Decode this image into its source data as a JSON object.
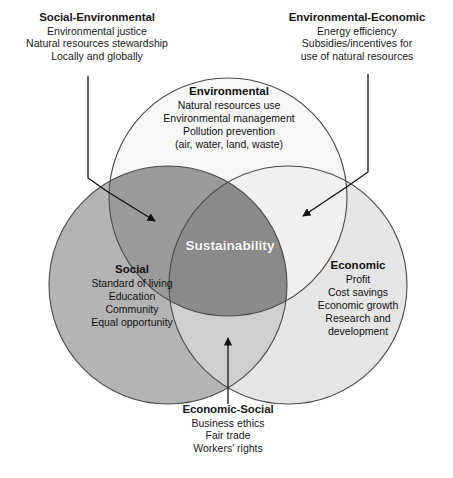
{
  "diagram": {
    "type": "venn-3-circle",
    "center_label": "Sustainability",
    "colors": {
      "social_fill": "#b4b4b4",
      "environmental_fill": "#f7f7f7",
      "economic_fill": "#e6e6e6",
      "social_environmental_fill": "#9a9a9a",
      "environmental_economic_fill": "#f2f2f2",
      "economic_social_fill": "#cfcfcf",
      "center_fill": "#8a8a8a",
      "stroke": "#4a4a4a",
      "center_text": "#ffffff",
      "body_text": "#1a1a1a",
      "background": "#ffffff"
    },
    "circles": [
      {
        "id": "environmental",
        "title": "Environmental",
        "lines": [
          "Natural resources use",
          "Environmental management",
          "Pollution prevention",
          "(air, water, land, waste)"
        ]
      },
      {
        "id": "social",
        "title": "Social",
        "lines": [
          "Standard of living",
          "Education",
          "Community",
          "Equal opportunity"
        ]
      },
      {
        "id": "economic",
        "title": "Economic",
        "lines": [
          "Profit",
          "Cost savings",
          "Economic growth",
          "Research and",
          "development"
        ]
      }
    ],
    "callouts": [
      {
        "id": "social-environmental",
        "title": "Social-Environmental",
        "lines": [
          "Environmental justice",
          "Natural resources stewardship",
          "Locally and globally"
        ]
      },
      {
        "id": "environmental-economic",
        "title": "Environmental-Economic",
        "lines": [
          "Energy efficiency",
          "Subsidies/incentives for",
          "use of natural resources"
        ]
      },
      {
        "id": "economic-social",
        "title": "Economic-Social",
        "lines": [
          "Business ethics",
          "Fair trade",
          "Workers' rights"
        ]
      }
    ],
    "caption_partial": ""
  }
}
